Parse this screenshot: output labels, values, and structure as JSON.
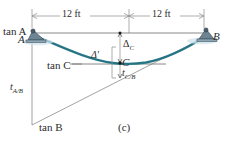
{
  "figure": {
    "part_label": "(c)",
    "title_semantic": "beam-deflection-moment-area-diagram",
    "colors": {
      "elastic_curve": "#2b7f8f",
      "elastic_curve_dark": "#1b5866",
      "line_gray": "#808080",
      "text": "#2b2b2b",
      "support_fill": "#5a6f7d",
      "support_shadow": "#bcd4e0"
    }
  },
  "dimensions": {
    "span_left": "12 ft",
    "span_right": "12 ft"
  },
  "points": {
    "a": "A",
    "b": "B",
    "c": "C"
  },
  "tangents": {
    "tan_a": "tan A",
    "tan_b": "tan B",
    "tan_c": "tan C"
  },
  "deflections": {
    "delta_c_symbol": "Δ",
    "delta_c_sub": "C",
    "delta_prime": "Δ′",
    "t_c_b_symbol": "t",
    "t_c_b_sub": "C/B",
    "t_a_b_symbol": "t",
    "t_a_b_sub": "A/B"
  }
}
